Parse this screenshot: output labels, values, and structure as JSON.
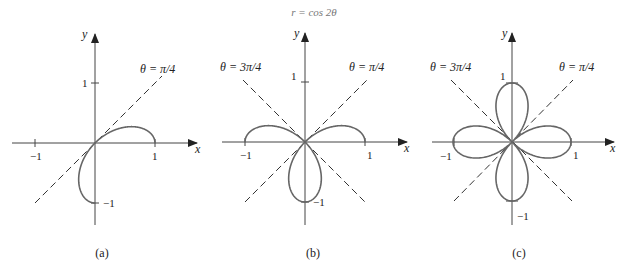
{
  "title": "r = cos 2θ",
  "panels": [
    {
      "caption": "(a)",
      "x_label": "x",
      "y_label": "y",
      "ticks": {
        "x_neg": "−1",
        "x_pos": "1",
        "y_pos": "1",
        "y_neg": "−1"
      },
      "lines": [
        {
          "label": "θ = π/4"
        }
      ],
      "theta_range": "0 to π/2"
    },
    {
      "caption": "(b)",
      "x_label": "x",
      "y_label": "y",
      "ticks": {
        "x_neg": "−1",
        "x_pos": "1",
        "y_pos": "1",
        "y_neg": "−1"
      },
      "lines": [
        {
          "label": "θ = 3π/4"
        },
        {
          "label": "θ = π/4"
        }
      ],
      "theta_range": "0 to π"
    },
    {
      "caption": "(c)",
      "x_label": "x",
      "y_label": "y",
      "ticks": {
        "x_neg": "−1",
        "x_pos": "1",
        "y_pos": "1",
        "y_neg": "−1"
      },
      "lines": [
        {
          "label": "θ = 3π/4"
        },
        {
          "label": "θ = π/4"
        }
      ],
      "theta_range": "0 to 2π"
    }
  ],
  "colors": {
    "curve": "#666666",
    "axis": "#444444",
    "dashed": "#333333"
  }
}
